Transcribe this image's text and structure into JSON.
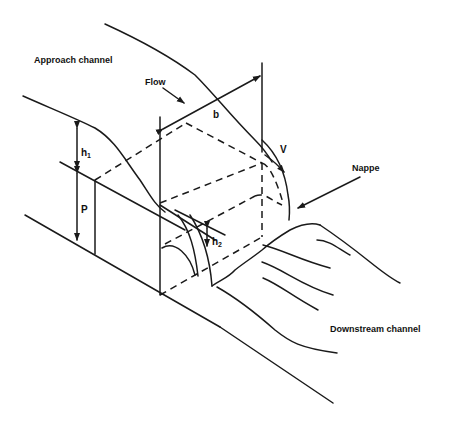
{
  "figure": {
    "type": "diagram",
    "colors": {
      "line": "#1a1a1a",
      "background": "#ffffff"
    }
  },
  "labels": {
    "approach_channel": "Approach channel",
    "flow": "Flow",
    "b": "b",
    "v": "V",
    "nappe": "Nappe",
    "h1_main": "h",
    "h1_sub": "1",
    "p": "P",
    "h2_main": "h",
    "h2_sub": "2",
    "downstream_channel": "Downstream channel"
  }
}
